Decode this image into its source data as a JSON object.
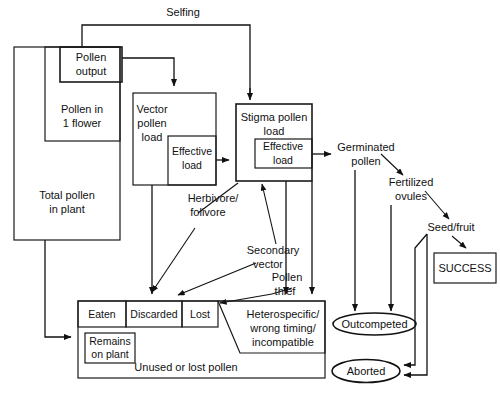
{
  "figure": {
    "background_color": "#ffffff",
    "line_color": "#111111"
  },
  "boxes": {
    "total_pollen": "Total pollen\nin plant",
    "total_pollen_line1": "Total pollen",
    "total_pollen_line2": "in plant",
    "pollen_in_flower_line1": "Pollen in",
    "pollen_in_flower_line2": "1 flower",
    "pollen_output_line1": "Pollen",
    "pollen_output_line2": "output",
    "vector_load_line1": "Vector",
    "vector_load_line2": "pollen",
    "vector_load_line3": "load",
    "vector_effective_line1": "Effective",
    "vector_effective_line2": "load",
    "stigma_load_line1": "Stigma pollen",
    "stigma_load_line2": "load",
    "stigma_effective_line1": "Effective",
    "stigma_effective_line2": "load",
    "eaten": "Eaten",
    "discarded": "Discarded",
    "lost": "Lost",
    "remains_on_plant_line1": "Remains",
    "remains_on_plant_line2": "on plant",
    "unused_or_lost": "Unused or lost pollen",
    "heterospecific_line1": "Heterospecific/",
    "heterospecific_line2": "wrong timing/",
    "heterospecific_line3": "incompatible",
    "success": "SUCCESS"
  },
  "labels": {
    "selfing": "Selfing",
    "germinated_line1": "Germinated",
    "germinated_line2": "pollen",
    "fertilized_line1": "Fertilized",
    "fertilized_line2": "ovules",
    "seed_fruit": "Seed/fruit",
    "herbivore_line1": "Herbivore/",
    "herbivore_line2": "folivore",
    "secondary_line1": "Secondary",
    "secondary_line2": "vector",
    "pollen_thief_line1": "Pollen",
    "pollen_thief_line2": "thief"
  },
  "outcomes": {
    "outcompeted": "Outcompeted",
    "aborted": "Aborted"
  }
}
